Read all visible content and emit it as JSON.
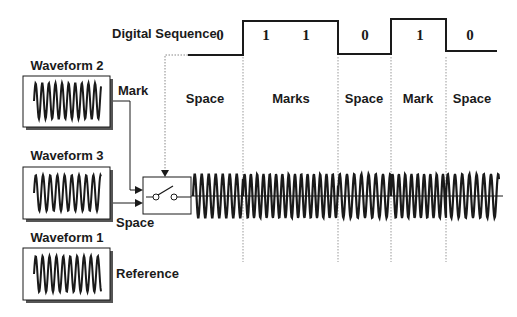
{
  "diagram": {
    "title": "Digital Sequence",
    "bits": [
      {
        "value": "0",
        "x": 220
      },
      {
        "value": "1",
        "x": 266
      },
      {
        "value": "1",
        "x": 306
      },
      {
        "value": "0",
        "x": 365
      },
      {
        "value": "1",
        "x": 420
      },
      {
        "value": "0",
        "x": 470
      }
    ],
    "segments": [
      {
        "label": "Space",
        "x": 205
      },
      {
        "label": "Marks",
        "x": 291
      },
      {
        "label": "Space",
        "x": 364
      },
      {
        "label": "Mark",
        "x": 418
      },
      {
        "label": "Space",
        "x": 472
      }
    ],
    "waveforms": [
      {
        "label": "Waveform 2",
        "port_label": "Mark"
      },
      {
        "label": "Waveform 3",
        "port_label": "Space"
      },
      {
        "label": "Waveform 1",
        "port_label": "Reference"
      }
    ],
    "switch_label": "switch",
    "colors": {
      "ink": "#1a1a1a",
      "dotted": "#888888",
      "shadow": "#555555"
    }
  }
}
